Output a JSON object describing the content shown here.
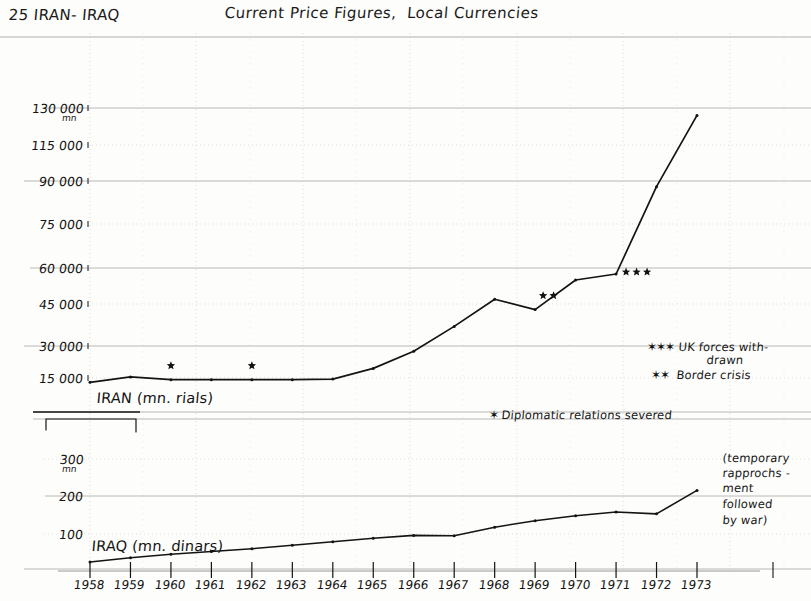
{
  "header": {
    "page_number": "25",
    "sheet_title": "IRAN- IRAQ",
    "chart_title": "Current Price Figures,  Local Currencies"
  },
  "chart_data": {
    "type": "line",
    "title": "Current Price Figures, Local Currencies",
    "subtitle": "IRAN- IRAQ",
    "xlabel": "",
    "x": [
      1958,
      1959,
      1960,
      1961,
      1962,
      1963,
      1964,
      1965,
      1966,
      1967,
      1968,
      1969,
      1970,
      1971,
      1972,
      1973
    ],
    "xtick_labels": [
      "1958",
      "1959",
      "1960",
      "1961",
      "1962",
      "1963",
      "1964",
      "1965",
      "1966",
      "1967",
      "1968",
      "1969",
      "1970",
      "1971",
      "1972",
      "1973"
    ],
    "grid": true,
    "legend_position": "right",
    "panels": [
      {
        "name": "iran-panel",
        "series_label": "IRAN (mn. rials)",
        "ylabel": "mn",
        "unit_note": "mn",
        "ytick_labels": [
          "130 000",
          "115 000",
          "90 000",
          "75 000",
          "60 000",
          "45 000",
          "30 000",
          "15 000"
        ],
        "ytick_values": [
          130000,
          115000,
          90000,
          75000,
          60000,
          45000,
          30000,
          15000
        ],
        "ylim": [
          0,
          145000
        ],
        "values": [
          13000,
          15500,
          14200,
          14200,
          14200,
          14200,
          14500,
          19500,
          27500,
          37000,
          47000,
          43000,
          55000,
          57500,
          88000,
          127000
        ]
      },
      {
        "name": "iraq-panel",
        "series_label": "IRAQ (mn. dinars)",
        "ylabel": "mn",
        "unit_note": "mn",
        "ytick_labels": [
          "300",
          "200",
          "100"
        ],
        "ytick_values": [
          300,
          200,
          100
        ],
        "ylim": [
          0,
          330
        ],
        "values": [
          20,
          32,
          42,
          50,
          58,
          68,
          78,
          88,
          96,
          95,
          118,
          135,
          148,
          158,
          153,
          215
        ]
      }
    ],
    "legend": [
      {
        "marker": "***",
        "label": "UK forces with-",
        "label2": "drawn"
      },
      {
        "marker": "**",
        "label": "Border crisis"
      }
    ],
    "annotations": [
      {
        "marker": "*",
        "text": "Diplomatic relations severed"
      },
      {
        "text": "(temporary",
        "text2": "rapprochs -",
        "text3": "ment",
        "text4": "followed",
        "text5": "by war)"
      }
    ],
    "event_markers": [
      {
        "stars": "*",
        "year": 1960,
        "panel": "iran-panel"
      },
      {
        "stars": "*",
        "year": 1962,
        "panel": "iran-panel"
      },
      {
        "stars": "**",
        "year": 1969,
        "panel": "iran-panel"
      },
      {
        "stars": "***",
        "year": 1971,
        "panel": "iran-panel"
      }
    ]
  },
  "yticks_iran": [
    {
      "label": "130 000",
      "sub": "mn",
      "top": 101
    },
    {
      "label": "115 000",
      "sub": "",
      "top": 138
    },
    {
      "label": "90 000",
      "sub": "",
      "top": 174
    },
    {
      "label": "75 000",
      "sub": "",
      "top": 217
    },
    {
      "label": "60 000",
      "sub": "",
      "top": 261
    },
    {
      "label": "45 000",
      "sub": "",
      "top": 297
    },
    {
      "label": "30 000",
      "sub": "",
      "top": 339
    },
    {
      "label": "15 000",
      "sub": "",
      "top": 371
    }
  ],
  "yticks_iraq": [
    {
      "label": "300",
      "sub": "mn",
      "top": 452
    },
    {
      "label": "200",
      "sub": "",
      "top": 489
    },
    {
      "label": "100",
      "sub": "",
      "top": 527
    }
  ],
  "xticks": [
    {
      "label": "1958",
      "left": 66
    },
    {
      "label": "1959",
      "left": 120
    },
    {
      "label": "1960",
      "left": 173
    },
    {
      "label": "1961",
      "left": 226
    },
    {
      "label": "1962",
      "left": 279
    },
    {
      "label": "1963",
      "left": 332
    },
    {
      "label": "1964",
      "left": 377
    },
    {
      "label": "1965",
      "left": 430
    },
    {
      "label": "1966",
      "left": 483
    },
    {
      "label": "1967",
      "left": 536
    },
    {
      "label": "1968",
      "left": 589
    },
    {
      "label": "1969",
      "left": 637
    },
    {
      "label": "1970",
      "left": 690
    },
    {
      "label": "1971",
      "left": 737
    },
    {
      "label": "1972",
      "left": 784
    },
    {
      "label": "1973",
      "left": 832
    }
  ],
  "series_labels": {
    "iran": "IRAN (mn. rials)",
    "iraq": "IRAQ (mn. dinars)"
  },
  "legend": {
    "uk_marker": "✶✶✶",
    "uk_line1": "UK forces with-",
    "uk_line2": "drawn",
    "border_marker": "✶✶",
    "border_label": "Border crisis"
  },
  "annotations": {
    "diplomatic_marker": "✶",
    "diplomatic_text": "Diplomatic relations severed",
    "war_note_l1": "(temporary",
    "war_note_l2": "rapprochs -",
    "war_note_l3": "ment",
    "war_note_l4": "followed",
    "war_note_l5": "by war)"
  },
  "colors": {
    "ink": "#141414",
    "paper": "#fdfdfb",
    "grid_solid": "#9a9a9a",
    "grid_dotted": "#c9c9c9"
  }
}
